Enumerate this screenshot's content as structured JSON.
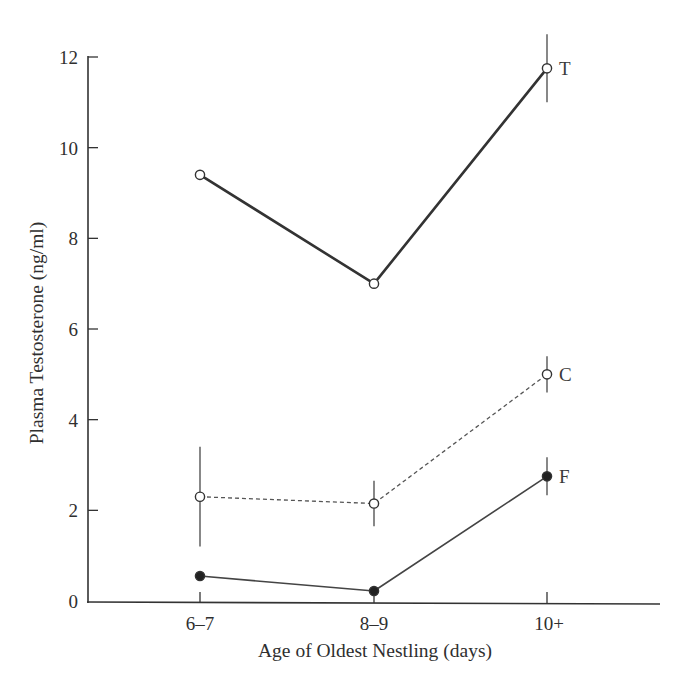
{
  "chart_data": {
    "type": "line",
    "title": "",
    "xlabel": "Age of Oldest Nestling (days)",
    "ylabel": "Plasma Testosterone (ng/ml)",
    "categories": [
      "6–7",
      "8–9",
      "10+"
    ],
    "yticks": [
      0,
      2,
      4,
      6,
      8,
      10,
      12
    ],
    "ylim": [
      0,
      12
    ],
    "grid": false,
    "legend": "inline labels at right end of each series",
    "series": [
      {
        "name": "T",
        "values": [
          9.4,
          7.0,
          11.75
        ],
        "errors": [
          null,
          null,
          0.75
        ],
        "marker": "open-circle",
        "line_style": "solid-thick"
      },
      {
        "name": "C",
        "values": [
          2.3,
          2.15,
          5.0
        ],
        "errors": [
          1.1,
          0.5,
          0.4
        ],
        "marker": "open-circle",
        "line_style": "dashed"
      },
      {
        "name": "F",
        "values": [
          0.55,
          0.22,
          2.75
        ],
        "errors": [
          null,
          null,
          0.42
        ],
        "marker": "filled-circle",
        "line_style": "solid-thin"
      }
    ]
  },
  "colors": {
    "axis": "#333333",
    "line": "#3a3a3a",
    "marker_fill_open": "#ffffff",
    "marker_fill_filled": "#222222"
  }
}
